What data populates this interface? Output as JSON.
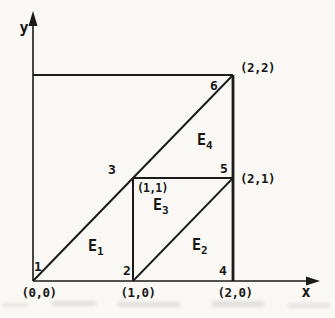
{
  "axes": {
    "x_label": "x",
    "y_label": "y"
  },
  "nodes": [
    {
      "id": "1",
      "x": 0,
      "y": 0,
      "coord_label": "(0,0)"
    },
    {
      "id": "2",
      "x": 1,
      "y": 0,
      "coord_label": "(1,0)"
    },
    {
      "id": "3",
      "x": 1,
      "y": 1,
      "coord_label": "(1,1)"
    },
    {
      "id": "4",
      "x": 2,
      "y": 0,
      "coord_label": "(2,0)"
    },
    {
      "id": "5",
      "x": 2,
      "y": 1,
      "coord_label": "(2,1)"
    },
    {
      "id": "6",
      "x": 2,
      "y": 2,
      "coord_label": "(2,2)"
    }
  ],
  "elements": [
    {
      "label": "E",
      "sub": "1",
      "nodes": [
        "1",
        "2",
        "3"
      ]
    },
    {
      "label": "E",
      "sub": "2",
      "nodes": [
        "2",
        "4",
        "5"
      ]
    },
    {
      "label": "E",
      "sub": "3",
      "nodes": [
        "2",
        "5",
        "3"
      ]
    },
    {
      "label": "E",
      "sub": "4",
      "nodes": [
        "3",
        "5",
        "6"
      ]
    }
  ],
  "colors": {
    "ink": "#1b1b1b",
    "paper": "#f9f8f4"
  }
}
